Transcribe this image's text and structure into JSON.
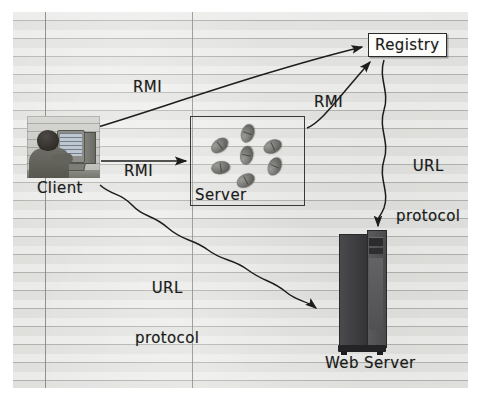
{
  "diagram": {
    "nodes": {
      "client": {
        "label": "Client",
        "icon": "person-at-computer-photo"
      },
      "server": {
        "label": "Server",
        "icon": "java-beans-group",
        "bean_count": 7
      },
      "registry": {
        "label": "Registry",
        "icon": "registry-box"
      },
      "web_server": {
        "label": "Web Server",
        "icon": "tower-computer-photo"
      }
    },
    "connections": [
      {
        "name": "client-to-registry",
        "label": "RMI",
        "style": "curved-arrow",
        "from": "client",
        "to": "registry"
      },
      {
        "name": "client-to-server",
        "label": "RMI",
        "style": "straight-arrow",
        "from": "client",
        "to": "server"
      },
      {
        "name": "server-to-registry",
        "label": "RMI",
        "style": "curved-arrow",
        "from": "server",
        "to": "registry"
      },
      {
        "name": "registry-to-web-server",
        "label": "URL\nprotocol",
        "label_line1": "URL",
        "label_line2": "protocol",
        "style": "wavy-arrow",
        "from": "registry",
        "to": "web_server"
      },
      {
        "name": "client-to-web-server",
        "label": "URL\nprotocol",
        "label_line1": "URL",
        "label_line2": "protocol",
        "style": "wavy-arrow",
        "from": "client",
        "to": "web_server"
      }
    ],
    "colors": {
      "paper": "#d9dad6",
      "rule_line": "#a0a39e",
      "ink": "#1b1b1b",
      "registry_fill": "#fdfdfc",
      "tower_dark": "#3c3c3e",
      "bean": "#7a7a76"
    }
  }
}
